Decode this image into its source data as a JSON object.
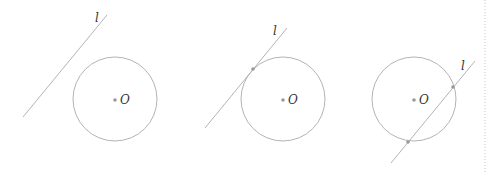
{
  "colors": {
    "stroke": "#b4b4b4",
    "point": "#9a9a9a",
    "label": "#333333",
    "divider": "#c8c8c8"
  },
  "figures": [
    {
      "name": "line-separate-from-circle",
      "circle": {
        "cx": 115,
        "cy": 99,
        "r": 42
      },
      "line": {
        "x1": 23,
        "y1": 117,
        "x2": 107,
        "y2": 15
      },
      "line_label": {
        "text": "l",
        "x": 95,
        "y": 22
      },
      "center_label": {
        "text": "O",
        "x": 120,
        "y": 104
      },
      "intersections": []
    },
    {
      "name": "line-tangent-to-circle",
      "circle": {
        "cx": 283,
        "cy": 99,
        "r": 42
      },
      "line": {
        "x1": 205,
        "y1": 128,
        "x2": 287,
        "y2": 28
      },
      "line_label": {
        "text": "l",
        "x": 273,
        "y": 35
      },
      "center_label": {
        "text": "O",
        "x": 288,
        "y": 104
      },
      "intersections": [
        {
          "x": 253,
          "y": 69
        }
      ]
    },
    {
      "name": "line-intersecting-circle",
      "circle": {
        "cx": 414,
        "cy": 99,
        "r": 42
      },
      "line": {
        "x1": 391,
        "y1": 163,
        "x2": 475,
        "y2": 61
      },
      "line_label": {
        "text": "l",
        "x": 461,
        "y": 70
      },
      "center_label": {
        "text": "O",
        "x": 419,
        "y": 104
      },
      "intersections": [
        {
          "x": 453,
          "y": 87
        },
        {
          "x": 408,
          "y": 142
        }
      ]
    }
  ],
  "divider": {
    "x": 485,
    "y1": 0,
    "y2": 172
  }
}
